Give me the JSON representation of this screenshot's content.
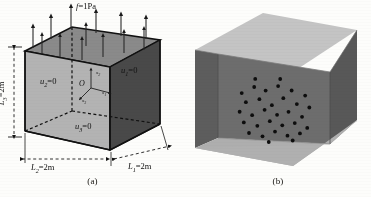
{
  "figure": {
    "panels": [
      {
        "caption": "(a)",
        "description": "cube-with-boundary-conditions",
        "load_label": "f",
        "load_eq": "=1Pa",
        "faces": [
          {
            "name": "left-face",
            "label": "u",
            "sub": "2",
            "eq": "=0"
          },
          {
            "name": "right-face",
            "label": "u",
            "sub": "1",
            "eq": "=0"
          },
          {
            "name": "bottom-face",
            "label": "u",
            "sub": "3",
            "eq": "=0"
          }
        ],
        "dimensions": [
          {
            "name": "height",
            "label": "L",
            "sub": "3",
            "eq": "=2m"
          },
          {
            "name": "depth",
            "label": "L",
            "sub": "2",
            "eq": "=2m"
          },
          {
            "name": "width",
            "label": "L",
            "sub": "1",
            "eq": "=2m"
          }
        ],
        "origin": "O",
        "axes": [
          {
            "label": "x",
            "sub": "1"
          },
          {
            "label": "x",
            "sub": "2"
          },
          {
            "label": "x",
            "sub": "3"
          }
        ],
        "arrow_count": 13
      },
      {
        "caption": "(b)",
        "description": "open-box-with-interior-collocation-points",
        "point_count": 33
      }
    ]
  },
  "colors": {
    "background": "#fdfdfb",
    "ink": "#111111",
    "top_face": "#8d8d8d",
    "left_face": "#b4b4b4",
    "right_face": "#4a4a4a",
    "bottom_face": "#bdbdbd",
    "b_top_face": "#c3c3c3",
    "b_wall_dark": "#6b6b6b",
    "b_wall_darker": "#5a5a5a",
    "b_floor": "#aeaeae",
    "point": "#0d0d0d"
  },
  "chart_data": {
    "type": "scatter",
    "title": "",
    "xlabel": "",
    "ylabel": "",
    "panel_b_points": [
      [
        0.18,
        0.3
      ],
      [
        0.3,
        0.22
      ],
      [
        0.41,
        0.26
      ],
      [
        0.53,
        0.2
      ],
      [
        0.66,
        0.25
      ],
      [
        0.79,
        0.31
      ],
      [
        0.22,
        0.41
      ],
      [
        0.35,
        0.37
      ],
      [
        0.47,
        0.44
      ],
      [
        0.58,
        0.35
      ],
      [
        0.71,
        0.42
      ],
      [
        0.83,
        0.46
      ],
      [
        0.16,
        0.53
      ],
      [
        0.28,
        0.57
      ],
      [
        0.4,
        0.5
      ],
      [
        0.52,
        0.56
      ],
      [
        0.63,
        0.52
      ],
      [
        0.76,
        0.58
      ],
      [
        0.2,
        0.66
      ],
      [
        0.33,
        0.7
      ],
      [
        0.45,
        0.64
      ],
      [
        0.57,
        0.69
      ],
      [
        0.69,
        0.66
      ],
      [
        0.81,
        0.72
      ],
      [
        0.25,
        0.79
      ],
      [
        0.38,
        0.83
      ],
      [
        0.5,
        0.77
      ],
      [
        0.62,
        0.82
      ],
      [
        0.74,
        0.79
      ],
      [
        0.31,
        0.12
      ],
      [
        0.55,
        0.11
      ],
      [
        0.44,
        0.9
      ],
      [
        0.67,
        0.88
      ]
    ]
  }
}
